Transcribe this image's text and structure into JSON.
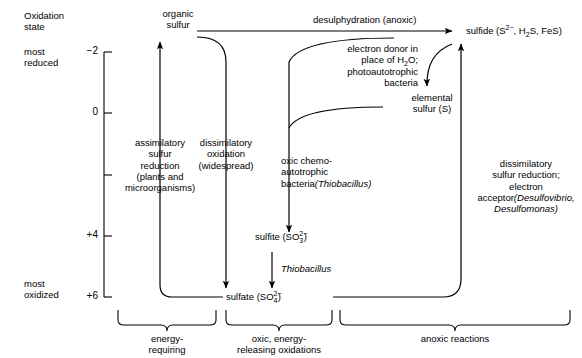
{
  "axis": {
    "title": "Oxidation\nstate",
    "most_reduced_label": "most\nreduced",
    "most_oxidized_label": "most\noxidized",
    "ticks": [
      {
        "value": -2,
        "label": "−2",
        "y": 52
      },
      {
        "value": 0,
        "label": "0",
        "y": 113
      },
      {
        "value": 2,
        "label": "",
        "y": 175
      },
      {
        "value": 4,
        "label": "+4",
        "y": 236
      },
      {
        "value": 6,
        "label": "+6",
        "y": 297
      }
    ]
  },
  "nodes": {
    "organic_sulfur": "organic\nsulfur",
    "sulfide": "sulfide (S",
    "sulfide_charge_sup": "2−",
    "sulfide_tail": ", H",
    "sulfide_h2s_sub": "2",
    "sulfide_tail2": "S, FeS)",
    "elemental_sulfur": "elemental\nsulfur (S)",
    "sulfite": "sulfite (SO",
    "sulfite_sub": "3",
    "sulfite_sup": "2−",
    "sulfite_tail": ")",
    "sulfate": "sulfate (SO",
    "sulfate_sub": "4",
    "sulfate_sup": "2−",
    "sulfate_tail": ")"
  },
  "process_labels": {
    "desulphydration": "desulphydration (anoxic)",
    "electron_donor": "electron donor in\nplace of H",
    "electron_donor_sub": "2",
    "electron_donor_tail": "O;\nphotoautotrophic\nbacteria",
    "assimilatory": "assimilatory\nsulfur\nreduction\n(plants and\nmicroorganisms)",
    "dissimilatory_oxidation": "dissimilatory\noxidation\n(widespread)",
    "oxic_chemo": "oxic chemo-\nautotrophic\nbacteria",
    "oxic_chemo_organism": "(Thiobacillus)",
    "thiobacillus": "Thiobacillus",
    "dissimilatory_reduction": "dissimilatory\nsulfur reduction;\nelectron acceptor",
    "dissimilatory_reduction_organisms": "(Desulfovibrio,\nDesulfomonas)"
  },
  "brackets": [
    {
      "name": "energy-requiring",
      "label": "energy-\nrequiring"
    },
    {
      "name": "oxic-energy-releasing-oxidations",
      "label": "oxic, energy-\nreleasing oxidations"
    },
    {
      "name": "anoxic-reactions",
      "label": "anoxic reactions"
    }
  ],
  "colors": {
    "stroke": "#000000",
    "background": "#ffffff"
  }
}
